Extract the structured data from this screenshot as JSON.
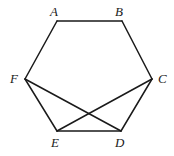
{
  "figure": {
    "type": "geometry-diagram",
    "shape": "hexagon",
    "canvas": {
      "width": 174,
      "height": 156,
      "background": "#ffffff"
    },
    "stroke_color": "#1a1a1a",
    "stroke_width": 1.5,
    "label_style": "italic-serif",
    "vertices": [
      {
        "id": "A",
        "label": "A",
        "x": 57,
        "y": 21,
        "label_x": 50,
        "label_y": 5,
        "label_position": "above-left"
      },
      {
        "id": "B",
        "label": "B",
        "x": 122,
        "y": 21,
        "label_x": 115,
        "label_y": 5,
        "label_position": "above-left"
      },
      {
        "id": "C",
        "label": "C",
        "x": 152,
        "y": 79,
        "label_x": 158,
        "label_y": 72,
        "label_position": "right"
      },
      {
        "id": "D",
        "label": "D",
        "x": 121,
        "y": 131,
        "label_x": 115,
        "label_y": 136,
        "label_position": "below"
      },
      {
        "id": "E",
        "label": "E",
        "x": 57,
        "y": 131,
        "label_x": 51,
        "label_y": 136,
        "label_position": "below"
      },
      {
        "id": "F",
        "label": "F",
        "x": 25,
        "y": 79,
        "label_x": 10,
        "label_y": 72,
        "label_position": "left"
      }
    ],
    "edges": [
      {
        "id": "AB",
        "from": "A",
        "to": "B",
        "x1": 57,
        "y1": 21,
        "x2": 122,
        "y2": 21
      },
      {
        "id": "BC",
        "from": "B",
        "to": "C",
        "x1": 122,
        "y1": 21,
        "x2": 152,
        "y2": 79
      },
      {
        "id": "CD",
        "from": "C",
        "to": "D",
        "x1": 152,
        "y1": 79,
        "x2": 121,
        "y2": 131
      },
      {
        "id": "DE",
        "from": "D",
        "to": "E",
        "x1": 121,
        "y1": 131,
        "x2": 57,
        "y2": 131
      },
      {
        "id": "EF",
        "from": "E",
        "to": "F",
        "x1": 57,
        "y1": 131,
        "x2": 25,
        "y2": 79
      },
      {
        "id": "FA",
        "from": "F",
        "to": "A",
        "x1": 25,
        "y1": 79,
        "x2": 57,
        "y2": 21
      }
    ],
    "diagonals": [
      {
        "id": "FD",
        "from": "F",
        "to": "D",
        "x1": 25,
        "y1": 79,
        "x2": 121,
        "y2": 131
      },
      {
        "id": "CE",
        "from": "C",
        "to": "E",
        "x1": 152,
        "y1": 79,
        "x2": 57,
        "y2": 131
      }
    ],
    "intersections": [
      {
        "id": "FD-CE",
        "x": 88,
        "y": 110
      }
    ]
  }
}
